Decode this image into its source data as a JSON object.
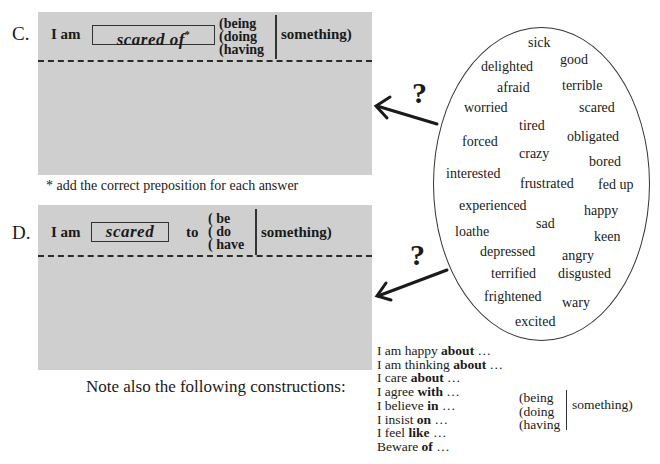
{
  "section_c": {
    "letter": "C.",
    "subject": "I am",
    "answer": "scared of",
    "asterisk": "*",
    "verbs": [
      "(being",
      "(doing",
      "(having"
    ],
    "object": "something)"
  },
  "footnote": "* add the correct preposition for each answer",
  "section_d": {
    "letter": "D.",
    "subject": "I am",
    "answer": "scared",
    "to": "to",
    "verbs": [
      "( be",
      "( do",
      "( have"
    ],
    "object": "something)"
  },
  "question_mark": "?",
  "adjectives": [
    "sick",
    "good",
    "delighted",
    "afraid",
    "terrible",
    "worried",
    "scared",
    "tired",
    "forced",
    "obligated",
    "crazy",
    "bored",
    "interested",
    "frustrated",
    "fed up",
    "experienced",
    "happy",
    "sad",
    "loathe",
    "keen",
    "depressed",
    "angry",
    "terrified",
    "disgusted",
    "frightened",
    "wary",
    "excited"
  ],
  "note": "Note also the following constructions:",
  "constructions": [
    {
      "pre": "I am happy ",
      "prep": "about",
      "post": " …"
    },
    {
      "pre": "I am thinking ",
      "prep": "about",
      "post": " …"
    },
    {
      "pre": "I care ",
      "prep": "about",
      "post": " …"
    },
    {
      "pre": "I agree ",
      "prep": "with",
      "post": " …"
    },
    {
      "pre": "I believe ",
      "prep": "in",
      "post": " …"
    },
    {
      "pre": "I insist ",
      "prep": "on",
      "post": " …"
    },
    {
      "pre": "I feel ",
      "prep": "like",
      "post": " …"
    },
    {
      "pre": "Beware ",
      "prep": "of",
      "post": " …"
    }
  ],
  "constructions_verbs": [
    "(being",
    "(doing",
    "(having"
  ],
  "constructions_object": "something)"
}
